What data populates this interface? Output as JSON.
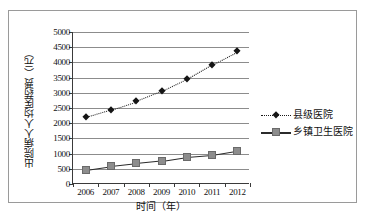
{
  "chart_data": {
    "type": "line",
    "title": "",
    "xlabel": "时间（年）",
    "ylabel": "出院病人人均医药费（元）",
    "categories": [
      "2006",
      "2007",
      "2008",
      "2009",
      "2010",
      "2011",
      "2012"
    ],
    "ylim": [
      0,
      5000
    ],
    "ytick_values": [
      0,
      500,
      1000,
      1500,
      2000,
      2500,
      3000,
      3500,
      4000,
      4500,
      5000
    ],
    "ytick_labels": [
      "0",
      "500",
      "1000",
      "1500",
      "2000",
      "2500",
      "3000",
      "3500",
      "4000",
      "4500",
      "5000"
    ],
    "grid": true,
    "legend_position": "right",
    "series": [
      {
        "name": "县级医院",
        "marker": "diamond",
        "line_style": "dotted",
        "color": "#151515",
        "values": [
          2200,
          2450,
          2720,
          3050,
          3450,
          3930,
          4360
        ]
      },
      {
        "name": "乡镇卫生医院",
        "marker": "square",
        "line_style": "solid",
        "color": "#8d8d8d",
        "values": [
          470,
          590,
          680,
          760,
          890,
          960,
          1100
        ]
      }
    ]
  }
}
